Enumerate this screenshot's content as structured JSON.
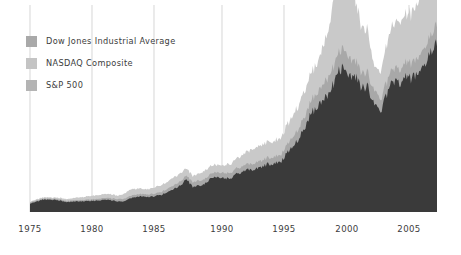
{
  "chart_data": {
    "type": "area",
    "title": "",
    "subtitle": "",
    "xlabel": "",
    "ylabel": "",
    "grid": "vertical-only",
    "legend_position": "top-left",
    "xlim": [
      1975,
      2007.5
    ],
    "ylim": [
      0,
      5500
    ],
    "xticks": [
      1975,
      1980,
      1985,
      1990,
      1995,
      2000,
      2005
    ],
    "xticklabels": [
      "1975",
      "1980",
      "1985",
      "1990",
      "1995",
      "2000",
      "2005"
    ],
    "yticks": [],
    "yticklabels": [],
    "colors": {
      "dow_jones": "#3a3a3a",
      "nasdaq": "#c9c9c9",
      "sp500": "#a8a8a8",
      "gridline": "#c4c4c4",
      "background": "#ffffff",
      "text": "#3c3c3c"
    },
    "series": [
      {
        "name": "Dow Jones Industrial Average",
        "color": "#3a3a3a",
        "x": [
          1975.0,
          1975.5,
          1976.0,
          1976.5,
          1977.0,
          1977.5,
          1978.0,
          1978.5,
          1979.0,
          1979.5,
          1980.0,
          1980.5,
          1981.0,
          1981.5,
          1982.0,
          1982.5,
          1983.0,
          1983.5,
          1984.0,
          1984.5,
          1985.0,
          1985.5,
          1986.0,
          1986.5,
          1987.0,
          1987.5,
          1988.0,
          1988.5,
          1989.0,
          1989.5,
          1990.0,
          1990.5,
          1991.0,
          1991.5,
          1992.0,
          1992.5,
          1993.0,
          1993.5,
          1994.0,
          1994.5,
          1995.0,
          1995.5,
          1996.0,
          1996.5,
          1997.0,
          1997.5,
          1998.0,
          1998.5,
          1999.0,
          1999.5,
          2000.0,
          2000.5,
          2001.0,
          2001.5,
          2002.0,
          2002.5,
          2003.0,
          2003.5,
          2004.0,
          2004.5,
          2005.0,
          2005.5,
          2006.0,
          2006.5,
          2007.0,
          2007.4
        ],
        "values": [
          640,
          820,
          960,
          990,
          940,
          870,
          780,
          820,
          840,
          870,
          880,
          900,
          960,
          920,
          850,
          830,
          1070,
          1210,
          1250,
          1180,
          1260,
          1320,
          1600,
          1850,
          2050,
          2600,
          1940,
          2090,
          2240,
          2650,
          2700,
          2680,
          2600,
          3000,
          3200,
          3300,
          3350,
          3580,
          3750,
          3820,
          3900,
          4600,
          5300,
          5800,
          6800,
          7900,
          8200,
          8900,
          9500,
          10800,
          11500,
          10800,
          10600,
          9800,
          9900,
          8200,
          8000,
          9200,
          10400,
          10200,
          10600,
          10400,
          11000,
          11600,
          12400,
          13200
        ]
      },
      {
        "name": "NASDAQ Composite",
        "color": "#c9c9c9",
        "x": [
          1975.0,
          1976.0,
          1977.0,
          1978.0,
          1979.0,
          1980.0,
          1981.0,
          1982.0,
          1983.0,
          1984.0,
          1985.0,
          1986.0,
          1987.0,
          1988.0,
          1989.0,
          1990.0,
          1991.0,
          1992.0,
          1993.0,
          1994.0,
          1995.0,
          1996.0,
          1997.0,
          1998.0,
          1999.0,
          1999.5,
          2000.0,
          2000.2,
          2000.5,
          2001.0,
          2001.5,
          2002.0,
          2002.5,
          2003.0,
          2004.0,
          2005.0,
          2006.0,
          2007.0,
          2007.4
        ],
        "values": [
          78,
          98,
          100,
          117,
          140,
          170,
          200,
          190,
          280,
          250,
          290,
          350,
          420,
          380,
          450,
          440,
          490,
          600,
          700,
          750,
          800,
          1050,
          1300,
          1570,
          2200,
          3400,
          4700,
          5048,
          3800,
          2500,
          2000,
          1900,
          1350,
          1400,
          2000,
          2100,
          2300,
          2500,
          2650
        ]
      },
      {
        "name": "S&P 500",
        "color": "#a8a8a8",
        "x": [
          1975.0,
          1977.0,
          1979.0,
          1981.0,
          1983.0,
          1985.0,
          1987.0,
          1989.0,
          1991.0,
          1993.0,
          1995.0,
          1997.0,
          1999.0,
          2000.0,
          2001.0,
          2002.0,
          2003.0,
          2004.0,
          2005.0,
          2006.0,
          2007.0,
          2007.4
        ],
        "values": [
          90,
          100,
          100,
          130,
          165,
          180,
          290,
          340,
          380,
          450,
          520,
          880,
          1280,
          1450,
          1250,
          1150,
          950,
          1120,
          1200,
          1280,
          1430,
          1500
        ]
      }
    ]
  },
  "legend": {
    "items": [
      {
        "label": "Dow Jones Industrial Average",
        "swatch_name": "legend-swatch-dow-jones",
        "color": "#a9a9a9"
      },
      {
        "label": "NASDAQ Composite",
        "swatch_name": "legend-swatch-nasdaq",
        "color": "#c4c4c4"
      },
      {
        "label": "S&P 500",
        "swatch_name": "legend-swatch-sp500",
        "color": "#b4b4b4"
      }
    ]
  },
  "axis": {
    "tick_labels": [
      "1975",
      "1980",
      "1985",
      "1990",
      "1995",
      "2000",
      "2005"
    ]
  }
}
